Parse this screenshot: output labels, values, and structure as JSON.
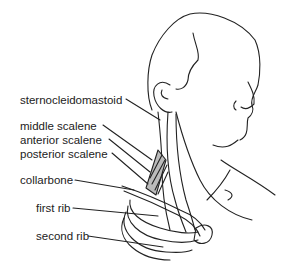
{
  "diagram": {
    "labels": [
      {
        "id": "sternocleidomastoid",
        "text": "sternocleidomastoid",
        "x": 20,
        "y": 101
      },
      {
        "id": "middle-scalene",
        "text": "middle scalene",
        "x": 20,
        "y": 127
      },
      {
        "id": "anterior-scalene",
        "text": "anterior scalene",
        "x": 20,
        "y": 141
      },
      {
        "id": "posterior-scalene",
        "text": "posterior scalene",
        "x": 20,
        "y": 155
      },
      {
        "id": "collarbone",
        "text": "collarbone",
        "x": 20,
        "y": 181
      },
      {
        "id": "first-rib",
        "text": "first rib",
        "x": 36,
        "y": 209
      },
      {
        "id": "second-rib",
        "text": "second rib",
        "x": 36,
        "y": 237
      }
    ],
    "colors": {
      "line": "#222222",
      "background": "#ffffff"
    }
  }
}
